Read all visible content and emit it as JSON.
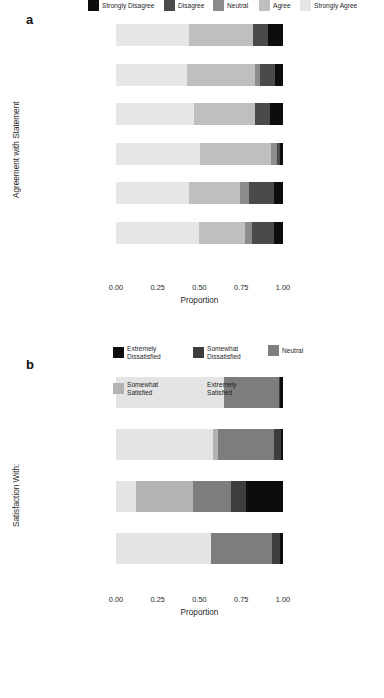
{
  "panel_a": {
    "letter": "a",
    "ylabel": "Agreement with Statement",
    "xlabel": "Proportion",
    "ticks": [
      "0.00",
      "0.25",
      "0.50",
      "0.75",
      "1.00"
    ],
    "legend": [
      {
        "label": "Strongly Disagree",
        "color": "#0d0d0d"
      },
      {
        "label": "Disagree",
        "color": "#4a4a4a"
      },
      {
        "label": "Neutral",
        "color": "#8c8c8c"
      },
      {
        "label": "Agree",
        "color": "#bfbfbf"
      },
      {
        "label": "Strongly Agree",
        "color": "#e6e6e6"
      }
    ]
  },
  "panel_b": {
    "letter": "b",
    "ylabel": "Satisfaction With:",
    "xlabel": "Proportion",
    "ticks": [
      "0.00",
      "0.25",
      "0.50",
      "0.75",
      "1.00"
    ],
    "legend": [
      {
        "label": "Extremely\nDissatisfied",
        "color": "#0d0d0d"
      },
      {
        "label": "Somewhat\nDissatisfied",
        "color": "#3d3d3d"
      },
      {
        "label": "Neutral",
        "color": "#7d7d7d"
      },
      {
        "label": "Somewhat\nSatisfied",
        "color": "#b3b3b3"
      },
      {
        "label": "Extremely\nSatisfied",
        "color": "#e4e4e4"
      }
    ]
  },
  "chart_data": [
    {
      "type": "bar",
      "orientation": "horizontal",
      "stacked": true,
      "normalized": true,
      "panel": "a",
      "title": "",
      "xlabel": "Proportion",
      "ylabel": "Agreement with Statement",
      "xlim": [
        0,
        1
      ],
      "xticks": [
        0.0,
        0.25,
        0.5,
        0.75,
        1.0
      ],
      "grid": false,
      "legend_position": "bottom",
      "categories": [
        "Would talk to supervisor\nabout leaving",
        "Supervisor would\nadvocate for me",
        "Supervisor interested\nin helping",
        "Supervisor encourages\nme",
        "Not difficult to ask\nfor help",
        "Mistakes not held\nagainst me"
      ],
      "series": [
        {
          "name": "Strongly Agree",
          "color": "#e6e6e6",
          "values": [
            0.435,
            0.425,
            0.465,
            0.505,
            0.435,
            0.495
          ]
        },
        {
          "name": "Agree",
          "color": "#bfbfbf",
          "values": [
            0.385,
            0.405,
            0.365,
            0.425,
            0.31,
            0.275
          ]
        },
        {
          "name": "Neutral",
          "color": "#8c8c8c",
          "values": [
            0.0,
            0.03,
            0.0,
            0.035,
            0.05,
            0.045
          ]
        },
        {
          "name": "Disagree",
          "color": "#4a4a4a",
          "values": [
            0.09,
            0.09,
            0.09,
            0.02,
            0.15,
            0.13
          ]
        },
        {
          "name": "Strongly Disagree",
          "color": "#0d0d0d",
          "values": [
            0.09,
            0.05,
            0.08,
            0.015,
            0.055,
            0.055
          ]
        }
      ]
    },
    {
      "type": "bar",
      "orientation": "horizontal",
      "stacked": true,
      "normalized": true,
      "panel": "b",
      "title": "",
      "xlabel": "Proportion",
      "ylabel": "Satisfaction With:",
      "xlim": [
        0,
        1
      ],
      "xticks": [
        0.0,
        0.25,
        0.5,
        0.75,
        1.0
      ],
      "grid": false,
      "legend_position": "bottom",
      "categories": [
        "Workplace environment",
        "Supervisor",
        "Current wage",
        "Current job/position"
      ],
      "series": [
        {
          "name": "Extremely Satisfied",
          "color": "#e4e4e4",
          "values": [
            0.645,
            0.58,
            0.12,
            0.57
          ]
        },
        {
          "name": "Somewhat Satisfied",
          "color": "#b3b3b3",
          "values": [
            0.0,
            0.03,
            0.34,
            0.0
          ]
        },
        {
          "name": "Neutral",
          "color": "#7d7d7d",
          "values": [
            0.33,
            0.335,
            0.23,
            0.365
          ]
        },
        {
          "name": "Somewhat Dissatisfied",
          "color": "#3d3d3d",
          "values": [
            0.01,
            0.045,
            0.09,
            0.05
          ]
        },
        {
          "name": "Extremely Dissatisfied",
          "color": "#0d0d0d",
          "values": [
            0.015,
            0.01,
            0.22,
            0.015
          ]
        }
      ]
    }
  ]
}
